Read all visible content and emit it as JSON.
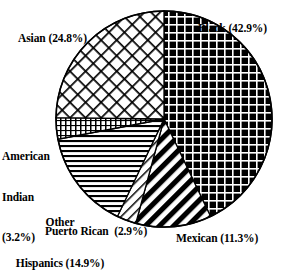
{
  "chart_data": {
    "type": "pie",
    "title": "",
    "subtitle": "",
    "xlabel": "",
    "ylabel": "",
    "legend_position": "none",
    "grid": false,
    "units": "percent",
    "start_angle_deg": 0,
    "direction": "clockwise",
    "categories": [
      "Black",
      "Mexican",
      "Puerto Rican",
      "Other Hispanics",
      "American Indian",
      "Asian"
    ],
    "values": [
      42.9,
      11.3,
      2.9,
      14.9,
      3.2,
      24.8
    ],
    "slices": [
      {
        "name": "Black",
        "value": 42.9,
        "label": "Black (42.9%)",
        "pattern": "dark-grid-checker",
        "fill": "#000000",
        "stroke": "#000000"
      },
      {
        "name": "Mexican",
        "value": 11.3,
        "label": "Mexican (11.3%)",
        "pattern": "bold-diagonal-stripes",
        "fill": "#000000",
        "stroke": "#000000"
      },
      {
        "name": "Puerto Rican",
        "value": 2.9,
        "label": "Puerto Rican  (2.9%)",
        "pattern": "thin-diagonal-lines",
        "fill": "#ffffff",
        "stroke": "#000000"
      },
      {
        "name": "Other Hispanics",
        "value": 14.9,
        "label_line1": "Other",
        "label_line2": "Hispanics (14.9%)",
        "pattern": "horizontal-lines",
        "fill": "#ffffff",
        "stroke": "#000000"
      },
      {
        "name": "American Indian",
        "value": 3.2,
        "label_line1": "American",
        "label_line2": "Indian",
        "label_line3": "(3.2%)",
        "pattern": "fine-vertical-grid",
        "fill": "#ffffff",
        "stroke": "#000000"
      },
      {
        "name": "Asian",
        "value": 24.8,
        "label": "Asian (24.8%)",
        "pattern": "diagonal-crosshatch",
        "fill": "#ffffff",
        "stroke": "#000000"
      }
    ]
  },
  "labels": {
    "asian": "Asian (24.8%)",
    "black": "Black (42.9%)",
    "american_indian_l1": "American",
    "american_indian_l2": "Indian",
    "american_indian_l3": "(3.2%)",
    "other_hispanics_l1": "Other",
    "other_hispanics_l2": "Hispanics (14.9%)",
    "puerto_rican": "Puerto Rican  (2.9%)",
    "mexican": "Mexican (11.3%)"
  },
  "geometry": {
    "center_x": 164,
    "center_y": 119,
    "radius": 108
  },
  "colors": {
    "ink": "#000000",
    "paper": "#ffffff"
  }
}
